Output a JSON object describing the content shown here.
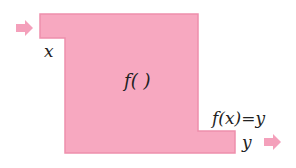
{
  "diagram": {
    "type": "function-machine",
    "colors": {
      "machine_fill": "#f7a8c0",
      "machine_edge": "#ee8fac",
      "arrow": "#f4a0bb"
    },
    "input_label": "x",
    "function_label": "f( )",
    "output_expression": "f(x)=y",
    "output_label": "y",
    "input_arrow_icon": "arrow-right-icon",
    "output_arrow_icon": "arrow-right-icon"
  }
}
